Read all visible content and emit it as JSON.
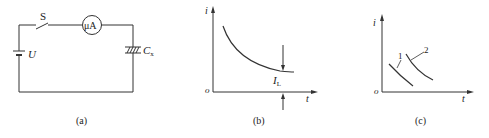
{
  "panel_a": {
    "switch_label": "S",
    "meter_label": "μA",
    "source_label": "U",
    "capacitor_label": "C",
    "capacitor_subscript": "x",
    "caption": "(a)"
  },
  "panel_b": {
    "y_axis": "i",
    "x_axis": "t",
    "origin": "o",
    "marker_label": "I",
    "marker_subscript": "L",
    "caption": "(b)"
  },
  "panel_c": {
    "y_axis": "i",
    "x_axis": "t",
    "origin": "o",
    "curve_labels": [
      "1",
      "2"
    ],
    "caption": "(c)"
  },
  "colors": {
    "line": "#333333",
    "background": "#ffffff"
  }
}
